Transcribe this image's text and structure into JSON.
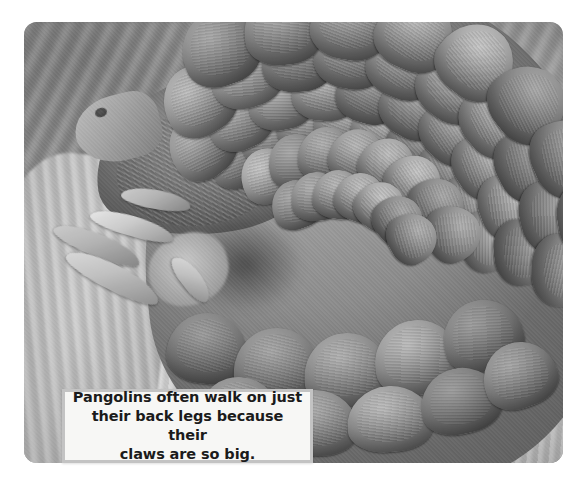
{
  "page": {
    "background_color": "#ffffff",
    "width": 586,
    "height": 486
  },
  "photo": {
    "subject": "pangolin",
    "description": "Close-up grayscale photograph of a pangolin resting on rocky ground, showing its overlapping keratin scales, head with a small dark eye, pointed snout and long curved front claws.",
    "style": "black-and-white",
    "corner_style": "rounded",
    "tones": {
      "highlight": "#e3e1dc",
      "midtone": "#9a9893",
      "shadow": "#3b3936"
    },
    "elements": {
      "head_label": "pangolin-head",
      "eye_label": "pangolin-eye",
      "snout_label": "pangolin-snout",
      "claws_label": "pangolin-claws",
      "scales_label": "pangolin-scales",
      "ground_label": "rocky-ground",
      "background_label": "blurred-wall"
    }
  },
  "caption": {
    "text": "Pangolins often walk on just their back legs because their claws are so big.",
    "lines": [
      "Pangolins often walk on just",
      "their back legs because their",
      "claws are so big."
    ],
    "text_color": "#1b1b1b",
    "background_color": "#f7f7f5",
    "border_color": "#c3c3c3"
  }
}
